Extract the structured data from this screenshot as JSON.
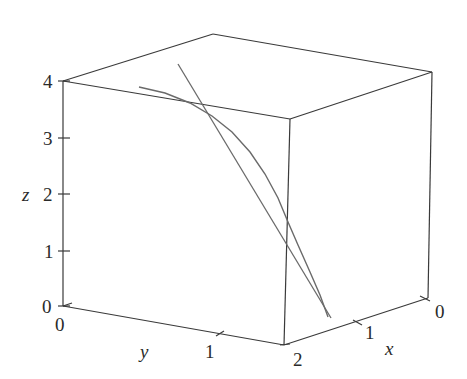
{
  "chart_data": {
    "type": "line3d",
    "title": "",
    "axes": {
      "x": {
        "label": "x",
        "ticks": [
          "0",
          "1",
          "2"
        ],
        "range": [
          0,
          2
        ]
      },
      "y": {
        "label": "y",
        "ticks": [
          "0",
          "1",
          "2"
        ],
        "range": [
          0,
          2
        ]
      },
      "z": {
        "label": "z",
        "ticks": [
          "0",
          "1",
          "2",
          "3",
          "4"
        ],
        "range": [
          0,
          4
        ]
      }
    },
    "grid": false,
    "legend": null,
    "series": [
      {
        "name": "curve",
        "kind": "space-curve",
        "description": "curved path descending from upper-left toward lower-right front"
      },
      {
        "name": "tangent-line",
        "kind": "straight-line",
        "description": "tangent line to the curve, touching it near the front edge"
      }
    ],
    "box": {
      "bottom_left": [
        63,
        306
      ],
      "bottom_front": [
        284,
        345
      ],
      "bottom_right": [
        428,
        298
      ],
      "top_left": [
        63,
        81
      ],
      "top_back": [
        213,
        34
      ],
      "top_right": [
        432,
        72
      ],
      "top_front": [
        290,
        119
      ]
    },
    "curve_points_px": [
      [
        139,
        87
      ],
      [
        165,
        93
      ],
      [
        190,
        103
      ],
      [
        212,
        116
      ],
      [
        232,
        132
      ],
      [
        250,
        152
      ],
      [
        265,
        174
      ],
      [
        278,
        198
      ],
      [
        288,
        222
      ],
      [
        298,
        245
      ],
      [
        310,
        272
      ],
      [
        320,
        295
      ],
      [
        328,
        317
      ]
    ],
    "tangent_points_px": [
      [
        178,
        64
      ],
      [
        331,
        318
      ]
    ]
  },
  "labels": {
    "z_axis": "z",
    "y_axis": "y",
    "x_axis": "x",
    "z_ticks": [
      "0",
      "1",
      "2",
      "3",
      "4"
    ],
    "y_ticks": [
      "0",
      "1",
      "2"
    ],
    "x_ticks": [
      "0",
      "1",
      "2"
    ]
  }
}
